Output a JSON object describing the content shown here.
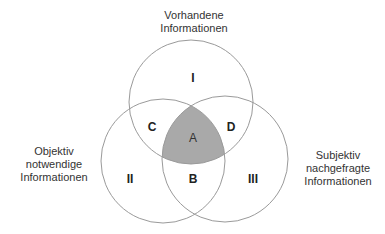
{
  "diagram": {
    "type": "venn-3",
    "colors": {
      "outline": "#9a9a9a",
      "intersection_fill": "#a9a9a9",
      "text": "#333333"
    },
    "circles": [
      {
        "id": "I",
        "caption_lines": [
          "Vorhandene",
          "Informationen"
        ],
        "cx": 191,
        "cy": 102,
        "r": 62
      },
      {
        "id": "II",
        "caption_lines": [
          "Objektiv",
          "notwendige",
          "Informationen"
        ],
        "cx": 163,
        "cy": 161,
        "r": 62
      },
      {
        "id": "III",
        "caption_lines": [
          "Subjektiv",
          "nachgefragte",
          "Informationen"
        ],
        "cx": 225,
        "cy": 159,
        "r": 63
      }
    ],
    "regions": {
      "I": "I",
      "II": "II",
      "III": "III",
      "A": "A",
      "B": "B",
      "C": "C",
      "D": "D"
    }
  }
}
